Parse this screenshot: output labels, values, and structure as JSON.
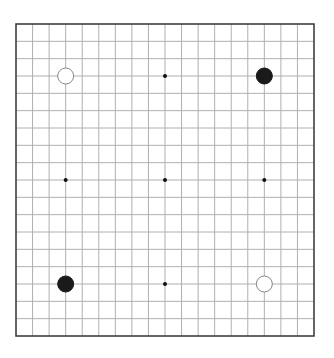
{
  "board": {
    "size": 19,
    "frame": {
      "left": 16,
      "top": 24,
      "right": 314,
      "bottom": 336
    },
    "line_color": "#b0b0b0",
    "frame_color": "#333333",
    "background": "#ffffff"
  },
  "star_points": [
    [
      9,
      3
    ],
    [
      3,
      9
    ],
    [
      9,
      9
    ],
    [
      15,
      9
    ],
    [
      9,
      15
    ]
  ],
  "stones": [
    {
      "color": "white",
      "col": 3,
      "row": 3
    },
    {
      "color": "black",
      "col": 15,
      "row": 3
    },
    {
      "color": "black",
      "col": 3,
      "row": 15
    },
    {
      "color": "white",
      "col": 15,
      "row": 15
    }
  ]
}
